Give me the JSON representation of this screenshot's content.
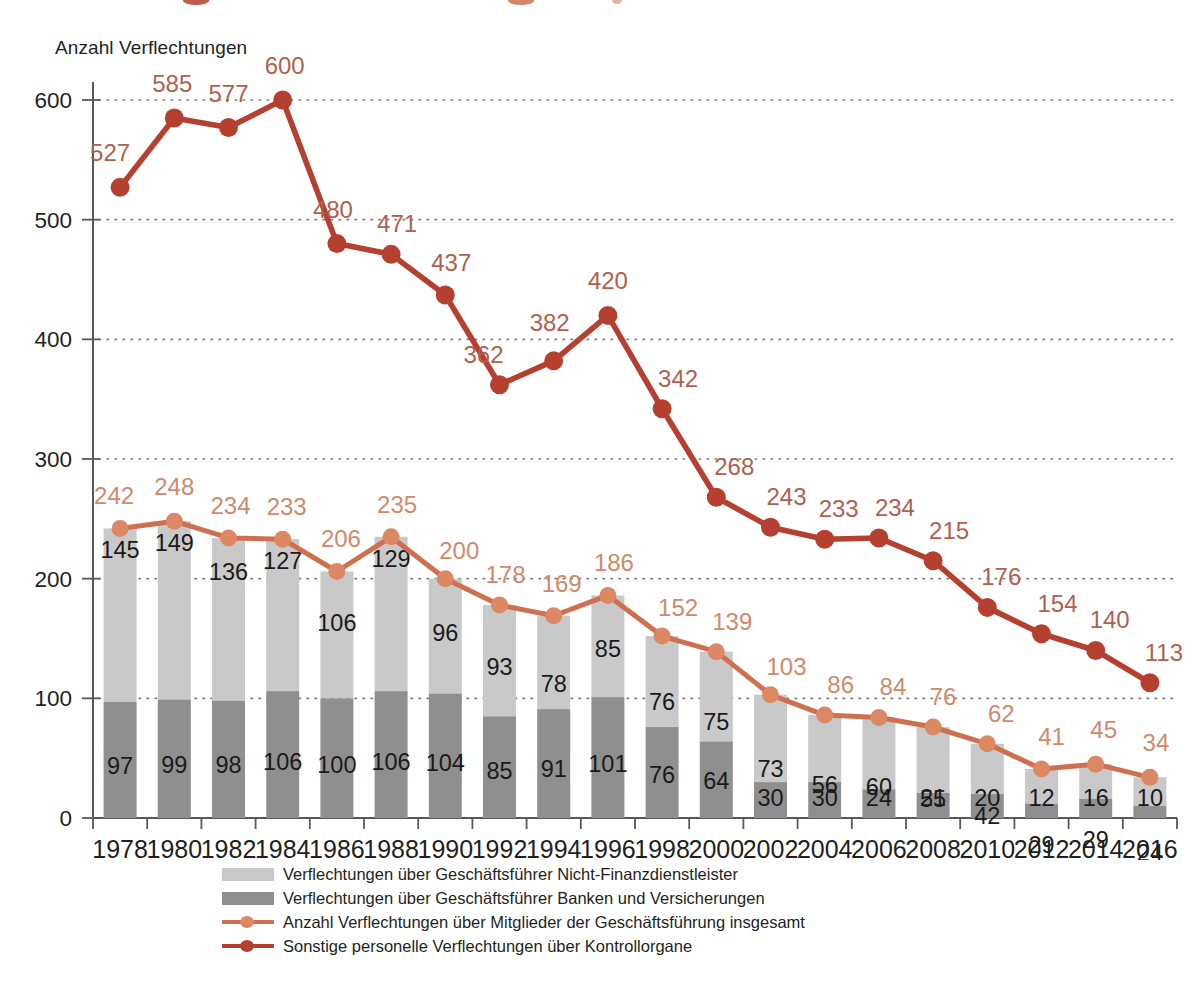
{
  "axis_title": "Anzahl Verflechtungen",
  "colors": {
    "dark_red_line": "#b5402f",
    "orange_line": "#ce7050",
    "orange_marker": "#dc8864",
    "bar_light": "#c9c9c9",
    "bar_dark": "#8f8f8f",
    "axis": "#58585a",
    "text": "#231f20"
  },
  "legend": {
    "items": [
      {
        "type": "swatch-light",
        "label": "Verflechtungen über Geschäftsführer Nicht-Finanzdienstleister"
      },
      {
        "type": "swatch-dark",
        "label": "Verflechtungen über Geschäftsführer Banken und Versicherungen"
      },
      {
        "type": "line-orange",
        "label": "Anzahl Verflechtungen über Mitglieder der Geschäftsführung insgesamt"
      },
      {
        "type": "line-red",
        "label": "Sonstige personelle Verflechtungen über Kontrollorgane"
      }
    ]
  },
  "chart_data": {
    "type": "bar",
    "title": "",
    "xlabel": "",
    "ylabel": "Anzahl Verflechtungen",
    "ylim": [
      0,
      600
    ],
    "yticks": [
      0,
      100,
      200,
      300,
      400,
      500,
      600
    ],
    "ytick_labels": [
      "0",
      "100",
      "200",
      "300",
      "400",
      "500",
      "600"
    ],
    "grid": true,
    "legend_position": "bottom",
    "categories": [
      "1978",
      "1980",
      "1982",
      "1984",
      "1986",
      "1988",
      "1990",
      "1992",
      "1994",
      "1996",
      "1998",
      "2000",
      "2002",
      "2004",
      "2006",
      "2008",
      "2010",
      "2012",
      "2014",
      "2016"
    ],
    "series": [
      {
        "name": "Verflechtungen über Geschäftsführer Banken und Versicherungen",
        "render": "bar-stacked-bottom",
        "color": "#8f8f8f",
        "values": [
          97,
          99,
          98,
          106,
          100,
          106,
          104,
          85,
          91,
          101,
          76,
          64,
          30,
          30,
          24,
          21,
          20,
          12,
          16,
          10
        ]
      },
      {
        "name": "Verflechtungen über Geschäftsführer Nicht-Finanzdienstleister",
        "render": "bar-stacked-top",
        "color": "#c9c9c9",
        "values": [
          145,
          149,
          136,
          127,
          106,
          129,
          96,
          93,
          78,
          85,
          76,
          75,
          73,
          56,
          60,
          55,
          42,
          29,
          29,
          24
        ]
      },
      {
        "name": "Anzahl Verflechtungen über Mitglieder der Geschäftsführung insgesamt",
        "render": "line",
        "color": "#ce7050",
        "values": [
          242,
          248,
          234,
          233,
          206,
          235,
          200,
          178,
          169,
          186,
          152,
          139,
          103,
          86,
          84,
          76,
          62,
          41,
          45,
          34
        ]
      },
      {
        "name": "Sonstige personelle Verflechtungen über Kontrollorgane",
        "render": "line",
        "color": "#b5402f",
        "values": [
          527,
          585,
          577,
          600,
          480,
          471,
          437,
          362,
          382,
          420,
          342,
          268,
          243,
          233,
          234,
          215,
          176,
          154,
          140,
          113
        ]
      }
    ]
  }
}
